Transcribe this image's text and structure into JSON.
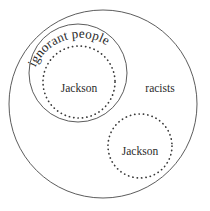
{
  "diagram": {
    "type": "euler-venn-diagram",
    "background_color": "#ffffff",
    "stroke_color": "#4a4a4a",
    "text_color": "#2b2b2b",
    "regions": [
      {
        "id": "racists",
        "label": "racists",
        "style": "solid",
        "cx": 103,
        "cy": 104,
        "r": 94,
        "label_x": 160,
        "label_y": 92
      },
      {
        "id": "ignorant-people",
        "label": "ignorant people",
        "style": "solid-curved-label",
        "cx": 78,
        "cy": 73,
        "r": 49,
        "label_curved": true
      },
      {
        "id": "jackson-upper",
        "label": "Jackson",
        "style": "dotted",
        "cx": 79,
        "cy": 82,
        "r": 36,
        "label_x": 79,
        "label_y": 92
      },
      {
        "id": "jackson-lower",
        "label": "Jackson",
        "style": "dotted",
        "cx": 140,
        "cy": 146,
        "r": 32,
        "label_x": 140,
        "label_y": 155
      }
    ],
    "labels": {
      "outer_set": "racists",
      "middle_set": "ignorant people",
      "inner_set_upper": "Jackson",
      "inner_set_lower": "Jackson"
    }
  }
}
